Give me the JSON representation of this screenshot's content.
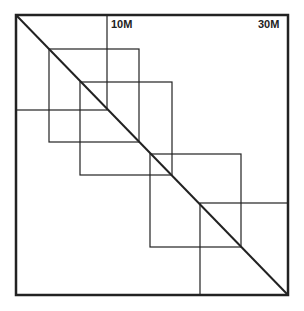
{
  "diagram": {
    "type": "overlapping-squares-along-diagonal",
    "colors": {
      "stroke": "#222222",
      "background": "#ffffff"
    },
    "labels": [
      {
        "id": "label-10m",
        "text": "10M",
        "x": 111,
        "y": 18
      },
      {
        "id": "label-30m",
        "text": "30M",
        "x": 258,
        "y": 18
      }
    ],
    "frame": {
      "x1": 16,
      "y1": 15,
      "x2": 288,
      "y2": 295
    },
    "diagonal": {
      "x1": 16,
      "y1": 15,
      "x2": 288,
      "y2": 295
    },
    "squares": [
      {
        "id": "square-0",
        "x1": 16,
        "y1": 15,
        "x2": 107,
        "y2": 110
      },
      {
        "id": "square-1",
        "x1": 49,
        "y1": 49,
        "x2": 139,
        "y2": 142
      },
      {
        "id": "square-2",
        "x1": 80,
        "y1": 82,
        "x2": 172,
        "y2": 175
      },
      {
        "id": "square-3",
        "x1": 150,
        "y1": 154,
        "x2": 241,
        "y2": 247
      },
      {
        "id": "square-4",
        "x1": 200,
        "y1": 203,
        "x2": 288,
        "y2": 295
      }
    ]
  }
}
